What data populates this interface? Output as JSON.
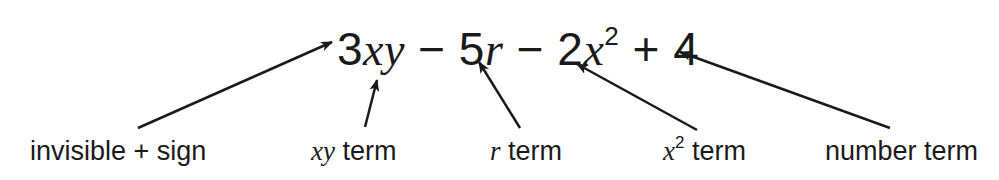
{
  "expression": {
    "parts": [
      "3",
      "xy",
      " − 5",
      "r",
      " − 2",
      "x",
      "2",
      " + 4"
    ]
  },
  "labels": [
    {
      "id": "invisible-plus",
      "text": "invisible + sign",
      "x": 30
    },
    {
      "id": "xy-term",
      "var": "xy",
      "text": " term",
      "x": 311
    },
    {
      "id": "r-term",
      "var": "r",
      "text": " term",
      "x": 490
    },
    {
      "id": "x2-term",
      "var": "x",
      "sup": "2",
      "text": " term",
      "x": 663
    },
    {
      "id": "number-term",
      "text": "number term",
      "x": 825
    }
  ],
  "arrows": [
    {
      "from": [
        138,
        128
      ],
      "to": [
        332,
        42
      ]
    },
    {
      "from": [
        365,
        127
      ],
      "to": [
        377,
        80
      ]
    },
    {
      "from": [
        520,
        128
      ],
      "to": [
        479,
        62
      ]
    },
    {
      "from": [
        697,
        130
      ],
      "to": [
        577,
        64
      ]
    },
    {
      "from": [
        890,
        128
      ],
      "to": [
        680,
        52
      ]
    }
  ],
  "colors": {
    "ink": "#1a1a1a",
    "background": "#ffffff"
  }
}
